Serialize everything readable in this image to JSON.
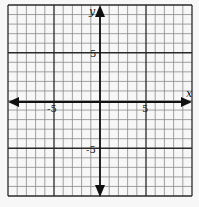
{
  "chart_data": {
    "type": "scatter",
    "title": "",
    "xlabel": "x",
    "ylabel": "y",
    "xlim": [
      -10,
      10
    ],
    "ylim": [
      -10,
      10
    ],
    "grid": true,
    "grid_step": 1,
    "major_grid_step": 5,
    "x_tick_labels": [
      "-5",
      "5"
    ],
    "y_tick_labels": [
      "5",
      "-5"
    ],
    "x_ticks": [
      -5,
      5
    ],
    "y_ticks": [
      5,
      -5
    ],
    "series": [],
    "legend": null
  },
  "axes": {
    "x_label": "x",
    "y_label": "y",
    "x_neg_label": "-5",
    "x_pos_label": "5",
    "y_pos_label": "5",
    "y_neg_label": "-5"
  },
  "colors": {
    "background": "#f7f7f7",
    "minor_grid": "#8a8a8a",
    "major_grid": "#2a2a2a",
    "axis": "#111111"
  }
}
